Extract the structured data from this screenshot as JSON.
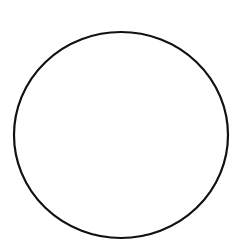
{
  "canvas": {
    "width": 247,
    "height": 242,
    "background": "#ffffff"
  },
  "shape": {
    "type": "ellipse",
    "cx": 121,
    "cy": 135,
    "rx": 107,
    "ry": 103,
    "stroke": "#111111",
    "stroke_width": 2.2,
    "fill": "none"
  }
}
